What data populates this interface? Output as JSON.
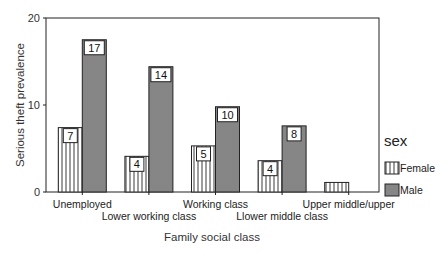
{
  "chart_data": {
    "type": "bar",
    "title": "",
    "xlabel": "Family social class",
    "ylabel": "Serious theft prevalence",
    "ylim": [
      0,
      20
    ],
    "yticks": [
      0,
      10,
      20
    ],
    "grid": false,
    "legend": {
      "title": "sex",
      "position": "right",
      "entries": [
        "Female",
        "Male"
      ]
    },
    "categories": [
      "Unemployed",
      "Lower working class",
      "Working class",
      "Llower middle class",
      "Upper middle/upper"
    ],
    "series": [
      {
        "name": "Female",
        "values": [
          7.4,
          4.1,
          5.3,
          3.6,
          1.1
        ],
        "labels": [
          "7",
          "4",
          "5",
          "4",
          ""
        ]
      },
      {
        "name": "Male",
        "values": [
          17.5,
          14.4,
          9.8,
          7.6,
          0
        ],
        "labels": [
          "17",
          "14",
          "10",
          "8",
          ""
        ]
      }
    ]
  },
  "colors": {
    "axis": "#222222",
    "female_fill": "#ffffff",
    "male_fill": "#8a8a8a",
    "hatch": "#222222"
  }
}
